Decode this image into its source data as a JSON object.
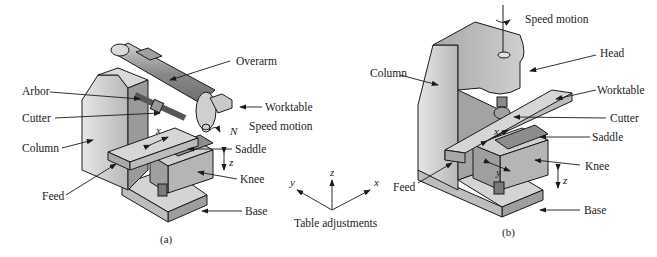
{
  "figure_a": {
    "caption": "(a)",
    "labels": {
      "overarm": "Overarm",
      "arbor": "Arbor",
      "cutter": "Cutter",
      "worktable": "Worktable",
      "speed_motion": "Speed motion",
      "speed_symbol": "N",
      "column": "Column",
      "saddle": "Saddle",
      "knee": "Knee",
      "feed": "Feed",
      "base": "Base",
      "axis_x": "x",
      "axis_z": "z"
    }
  },
  "axes_legend": {
    "title": "Table adjustments",
    "x": "x",
    "y": "y",
    "z": "z"
  },
  "figure_b": {
    "caption": "(b)",
    "labels": {
      "speed_motion": "Speed motion",
      "head": "Head",
      "column": "Column",
      "worktable": "Worktable",
      "cutter": "Cutter",
      "saddle": "Saddle",
      "knee": "Knee",
      "feed": "Feed",
      "base": "Base",
      "axis_x": "x",
      "axis_y": "y",
      "axis_z": "z"
    }
  }
}
